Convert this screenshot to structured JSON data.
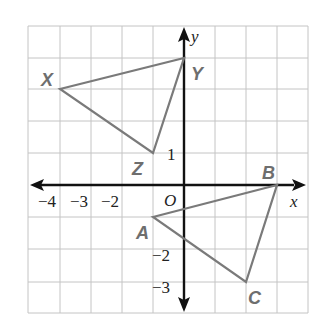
{
  "diagram": {
    "type": "coordinate-plane",
    "grid": {
      "x_min": -5,
      "x_max": 4,
      "y_min": -4,
      "y_max": 5,
      "unit": 1
    },
    "axes": {
      "x_label": "x",
      "y_label": "y",
      "origin_label": "O"
    },
    "x_ticks": [
      {
        "value": -4,
        "label": "−4"
      },
      {
        "value": -3,
        "label": "−3"
      },
      {
        "value": -2,
        "label": "−2"
      }
    ],
    "y_ticks": [
      {
        "value": 1,
        "label": "1"
      },
      {
        "value": -2,
        "label": "−2"
      },
      {
        "value": -3,
        "label": "−3"
      }
    ],
    "triangles": [
      {
        "name": "XYZ",
        "vertices": [
          {
            "label": "X",
            "x": -4,
            "y": 3
          },
          {
            "label": "Y",
            "x": 0,
            "y": 4
          },
          {
            "label": "Z",
            "x": -1,
            "y": 1
          }
        ]
      },
      {
        "name": "ABC",
        "vertices": [
          {
            "label": "A",
            "x": -1,
            "y": -1
          },
          {
            "label": "B",
            "x": 3,
            "y": 0
          },
          {
            "label": "C",
            "x": 2,
            "y": -3
          }
        ]
      }
    ],
    "colors": {
      "grid": "#c4c4c4",
      "axis": "#111111",
      "triangle": "#7a7a7a",
      "vertex_label": "#6e6e6e"
    }
  }
}
